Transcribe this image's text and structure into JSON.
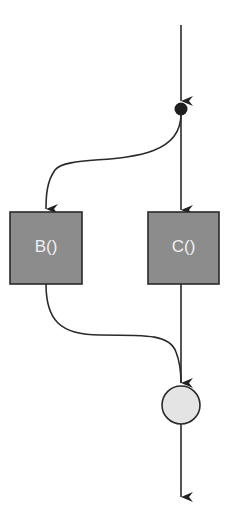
{
  "diagram": {
    "nodes": [
      {
        "id": "fork",
        "type": "fork-dot"
      },
      {
        "id": "B",
        "label": "B()",
        "type": "process"
      },
      {
        "id": "C",
        "label": "C()",
        "type": "process"
      },
      {
        "id": "join",
        "type": "join-circle"
      }
    ],
    "edges": [
      {
        "from": "start",
        "to": "fork"
      },
      {
        "from": "fork",
        "to": "B"
      },
      {
        "from": "fork",
        "to": "C"
      },
      {
        "from": "B",
        "to": "join"
      },
      {
        "from": "C",
        "to": "join"
      },
      {
        "from": "join",
        "to": "end"
      }
    ],
    "colors": {
      "box_fill": "#8c8c8c",
      "stroke": "#2a2a2a",
      "circle_fill": "#e4e4e4",
      "label": "#f0f0f0"
    }
  }
}
